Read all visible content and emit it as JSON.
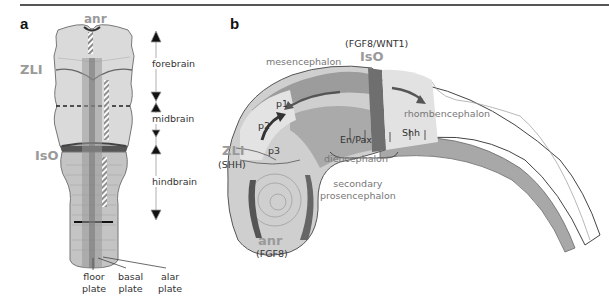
{
  "figure": {
    "top_rule": true,
    "accent_colors": {
      "tissue_light": "#dcdcdc",
      "tissue_mid": "#b8b8b8",
      "tissue_dark": "#7a7a7a",
      "boundary_dark": "#555555",
      "organizer_label": "#9a9a9a",
      "text": "#333333"
    }
  },
  "panel_a": {
    "letter": "a",
    "organizers": {
      "anr": "anr",
      "zli": "ZLI",
      "iso": "IsO"
    },
    "regions": [
      {
        "label": "forebrain"
      },
      {
        "label": "midbrain"
      },
      {
        "label": "hindbrain"
      }
    ],
    "plates": [
      {
        "line1": "floor",
        "line2": "plate"
      },
      {
        "line1": "basal",
        "line2": "plate"
      },
      {
        "line1": "alar",
        "line2": "plate"
      }
    ]
  },
  "panel_b": {
    "letter": "b",
    "iso": {
      "genes": "(FGF8/WNT1)",
      "label": "IsO"
    },
    "zli": {
      "label": "ZLI",
      "genes": "(SHH)"
    },
    "anr": {
      "label": "anr",
      "genes": "(FGF8)"
    },
    "regions": {
      "mesencephalon": "mesencephalon",
      "rhombencephalon": "rhombencephalon",
      "diencephalon": "diencephalon",
      "secondary_line1": "secondary",
      "secondary_line2": "prosencephalon"
    },
    "prosomeres": [
      "p1",
      "p2",
      "p3"
    ],
    "markers": {
      "en_pax": "En/Pax",
      "shh": "Shh"
    }
  }
}
